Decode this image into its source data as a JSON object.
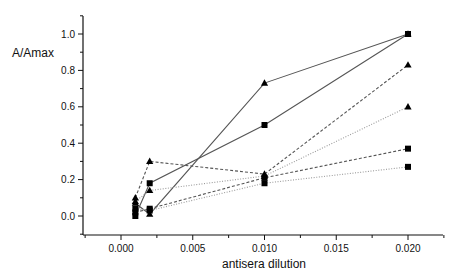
{
  "chart_data": {
    "type": "line",
    "title": "",
    "xlabel": "antisera dilution",
    "ylabel": "A/Amax",
    "xlim": [
      -0.0027,
      0.0225
    ],
    "ylim": [
      -0.1,
      1.1
    ],
    "x_ticks": [
      "0.000",
      "0.005",
      "0.010",
      "0.015",
      "0.020"
    ],
    "x_tick_values": [
      0.0,
      0.005,
      0.01,
      0.015,
      0.02
    ],
    "y_ticks": [
      "0.0",
      "0.2",
      "0.4",
      "0.6",
      "0.8",
      "1.0"
    ],
    "y_tick_values": [
      0.0,
      0.2,
      0.4,
      0.6,
      0.8,
      1.0
    ],
    "grid": false,
    "legend": null,
    "x": [
      0.001,
      0.002,
      0.01,
      0.02
    ],
    "series": [
      {
        "name": "solid-triangle",
        "line_style": "solid",
        "marker": "triangle",
        "values": [
          0.07,
          0.01,
          0.73,
          1.0
        ]
      },
      {
        "name": "solid-square",
        "line_style": "solid",
        "marker": "square",
        "values": [
          0.0,
          0.18,
          0.5,
          1.0
        ]
      },
      {
        "name": "dashed-triangle",
        "line_style": "dashed",
        "marker": "triangle",
        "values": [
          0.1,
          0.3,
          0.23,
          0.83
        ]
      },
      {
        "name": "dashed-square",
        "line_style": "dashed",
        "marker": "square",
        "values": [
          0.02,
          0.04,
          0.21,
          0.37
        ]
      },
      {
        "name": "dotted-triangle",
        "line_style": "dotted",
        "marker": "triangle",
        "values": [
          0.08,
          0.14,
          0.22,
          0.6
        ]
      },
      {
        "name": "dotted-square",
        "line_style": "dotted",
        "marker": "square",
        "values": [
          0.04,
          0.03,
          0.18,
          0.27
        ]
      }
    ]
  },
  "colors": {
    "axis": "#111111",
    "solid": "#555555",
    "dashed": "#555555",
    "dotted": "#9a9a9a",
    "marker": "#000000"
  }
}
